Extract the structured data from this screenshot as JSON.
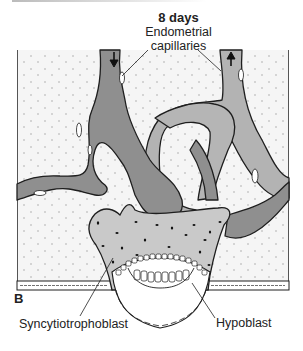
{
  "figure": {
    "panel_letter": "B",
    "stage": "8 days",
    "labels": {
      "capillaries_line1": "Endometrial",
      "capillaries_line2": "capillaries",
      "syncytiotrophoblast": "Syncytiotrophoblast",
      "hypoblast": "Hypoblast"
    },
    "arrows": [
      {
        "position": "left-vessel",
        "direction": "down"
      },
      {
        "position": "right-vessel",
        "direction": "up"
      }
    ],
    "colors": {
      "stroma": "#f4f4f4",
      "stroma_dots": "#9a9a9a",
      "vessel_dark": "#8f8f8f",
      "vessel_light": "#b5b5b5",
      "syncytium": "#c9c9c9",
      "outline": "#1e1e1e"
    }
  }
}
